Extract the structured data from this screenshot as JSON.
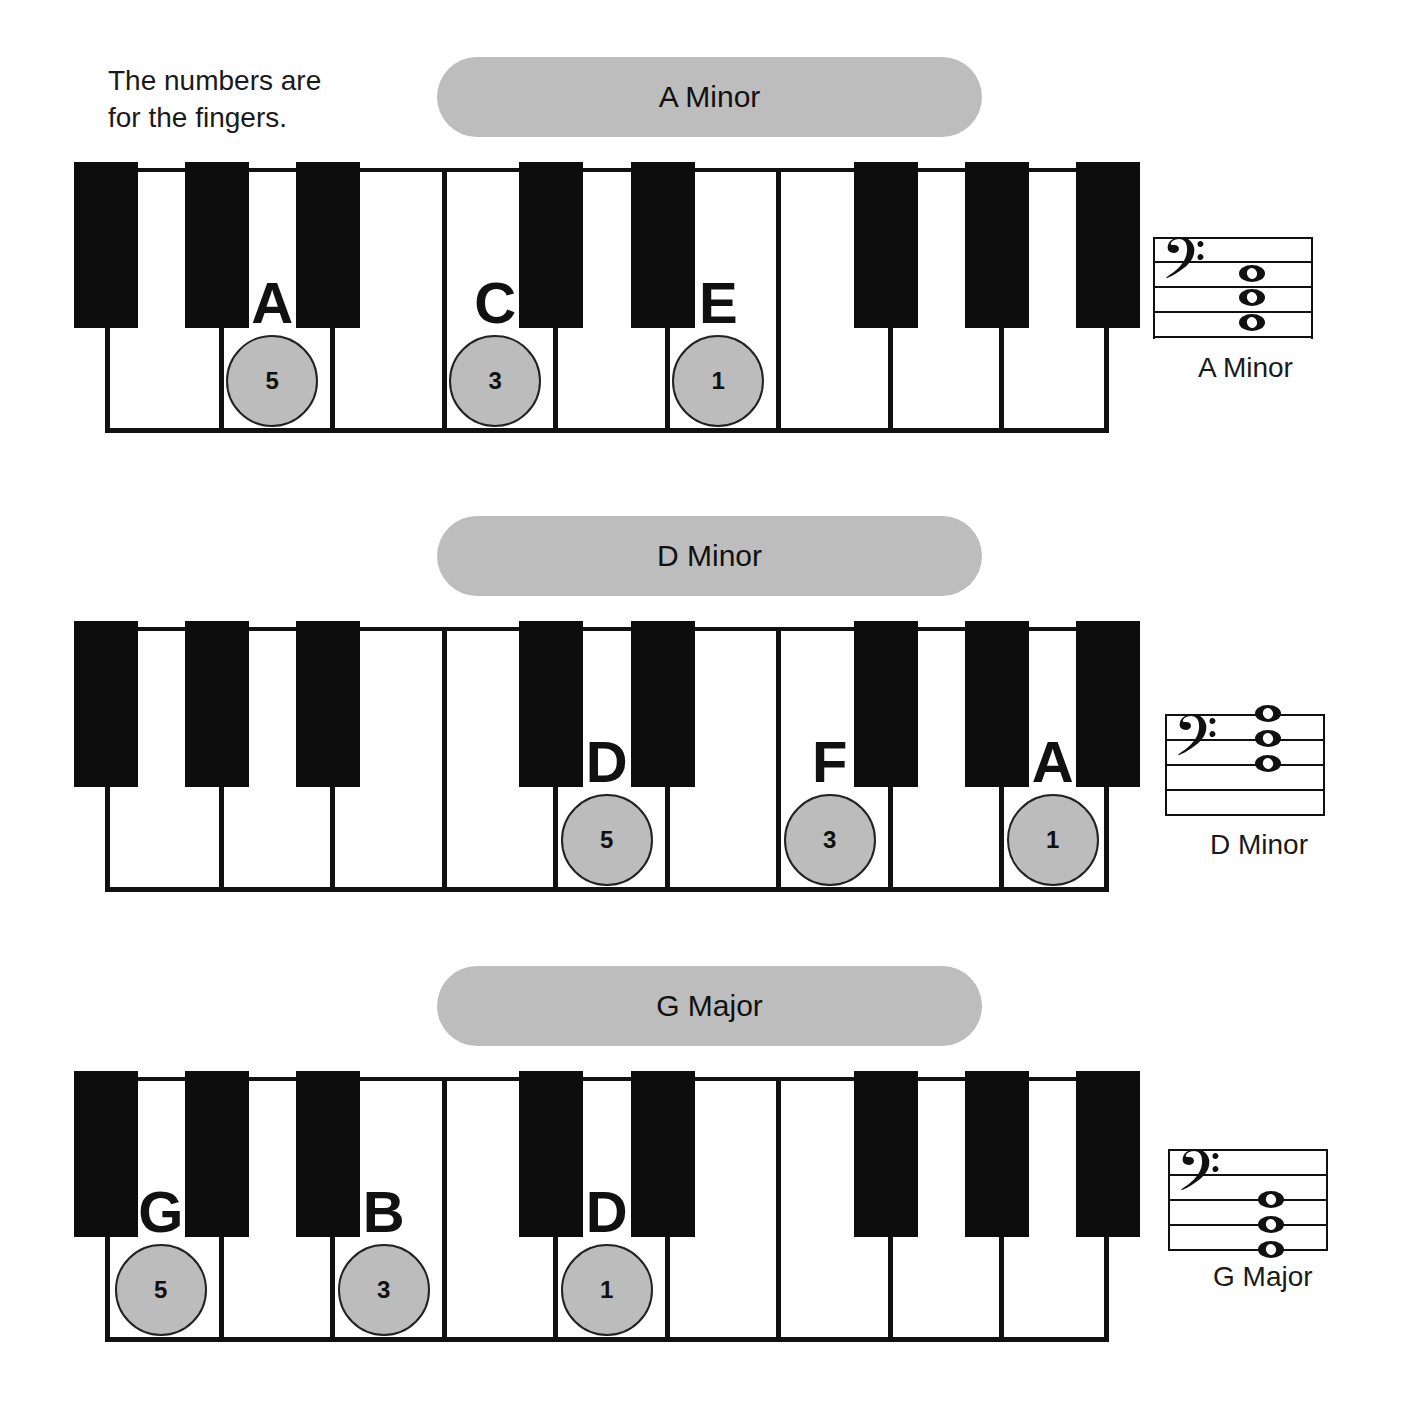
{
  "intro": {
    "line1": "The numbers are",
    "line2": "for the fingers."
  },
  "colors": {
    "pill": "#bdbdbd",
    "finger_circle": "#bcbcbc",
    "black_key": "#0d0d0d",
    "white_key": "#ffffff"
  },
  "chords": [
    {
      "title": "A Minor",
      "staff_label": "A Minor",
      "clef_icon": "bass-clef-icon",
      "notes": [
        {
          "letter": "A",
          "finger": "5",
          "white_key_index": 1
        },
        {
          "letter": "C",
          "finger": "3",
          "white_key_index": 3
        },
        {
          "letter": "E",
          "finger": "1",
          "white_key_index": 5
        }
      ]
    },
    {
      "title": "D Minor",
      "staff_label": "D Minor",
      "clef_icon": "bass-clef-icon",
      "notes": [
        {
          "letter": "D",
          "finger": "5",
          "white_key_index": 4
        },
        {
          "letter": "F",
          "finger": "3",
          "white_key_index": 6
        },
        {
          "letter": "A",
          "finger": "1",
          "white_key_index": 8
        }
      ]
    },
    {
      "title": "G Major",
      "staff_label": "G Major",
      "clef_icon": "bass-clef-icon",
      "notes": [
        {
          "letter": "G",
          "finger": "5",
          "white_key_index": 0
        },
        {
          "letter": "B",
          "finger": "3",
          "white_key_index": 2
        },
        {
          "letter": "D",
          "finger": "1",
          "white_key_index": 4
        }
      ]
    }
  ]
}
